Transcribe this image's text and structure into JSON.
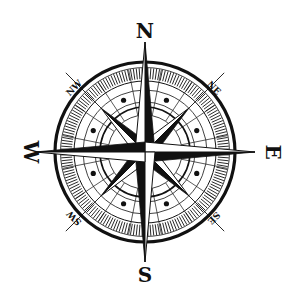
{
  "compass": {
    "center": [
      145,
      152
    ],
    "colors": {
      "ink": "#111111",
      "background": "#ffffff"
    },
    "cardinal_labels": [
      {
        "key": "n",
        "text": "N",
        "x": 145,
        "y": 38,
        "rotate": 0
      },
      {
        "key": "e",
        "text": "E",
        "x": 266,
        "y": 158,
        "rotate": 90
      },
      {
        "key": "s",
        "text": "S",
        "x": 145,
        "y": 282,
        "rotate": 0
      },
      {
        "key": "w",
        "text": "W",
        "x": 24,
        "y": 158,
        "rotate": 90
      }
    ],
    "intercardinal_labels": [
      {
        "key": "ne",
        "text": "NE",
        "x": 215,
        "y": 86,
        "rotate": 45
      },
      {
        "key": "se",
        "text": "SE",
        "x": 215,
        "y": 222,
        "rotate": 135
      },
      {
        "key": "sw",
        "text": "SW",
        "x": 73,
        "y": 222,
        "rotate": 225
      },
      {
        "key": "nw",
        "text": "NW",
        "x": 73,
        "y": 86,
        "rotate": -45
      }
    ]
  }
}
